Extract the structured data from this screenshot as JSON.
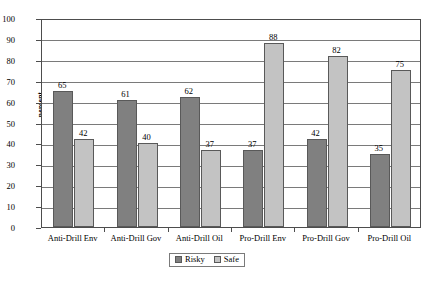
{
  "chart_data": {
    "type": "bar",
    "title": "",
    "xlabel": "",
    "ylabel": "percent",
    "ylim": [
      0,
      100
    ],
    "ytick_step": 10,
    "yticks": [
      100,
      90,
      80,
      70,
      60,
      50,
      40,
      30,
      20,
      10,
      0
    ],
    "grid": true,
    "legend_position": "bottom-center",
    "categories": [
      "Anti-Drill Env",
      "Anti-Drill Gov",
      "Anti-Drill Oil",
      "Pro-Drill Env",
      "Pro-Drill Gov",
      "Pro-Drill Oil"
    ],
    "series": [
      {
        "name": "Risky",
        "color": "#808080",
        "values": [
          65,
          61,
          62,
          37,
          42,
          35
        ]
      },
      {
        "name": "Safe",
        "color": "#c3c3c3",
        "values": [
          42,
          40,
          37,
          88,
          82,
          75
        ]
      }
    ]
  }
}
